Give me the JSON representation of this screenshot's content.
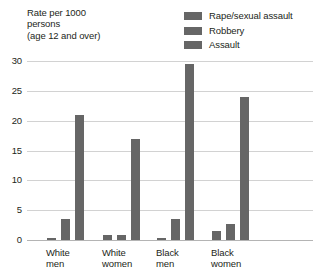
{
  "axis_title": "Rate per 1000\npersons\n(age 12 and over)",
  "legend": {
    "items": [
      {
        "label": "Rape/sexual assault",
        "color": "#666666",
        "icon": "legend-swatch-icon"
      },
      {
        "label": "Robbery",
        "color": "#666666",
        "icon": "legend-swatch-icon"
      },
      {
        "label": "Assault",
        "color": "#666666",
        "icon": "legend-swatch-icon"
      }
    ]
  },
  "chart_data": {
    "type": "bar",
    "title": "",
    "xlabel": "",
    "ylabel": "Rate per 1000 persons (age 12 and over)",
    "ylim": [
      0,
      30
    ],
    "yticks": [
      0,
      5,
      10,
      15,
      20,
      25,
      30
    ],
    "grid": true,
    "legend_position": "top-right",
    "categories": [
      "White\nmen",
      "White\nwomen",
      "Black\nmen",
      "Black\nwomen"
    ],
    "category_labels_flat": [
      "White men",
      "White women",
      "Black men",
      "Black women"
    ],
    "series": [
      {
        "name": "Rape/sexual assault",
        "color": "#666666",
        "values": [
          0.3,
          0.8,
          0.4,
          1.5
        ]
      },
      {
        "name": "Robbery",
        "color": "#666666",
        "values": [
          3.5,
          0.9,
          3.5,
          2.7
        ]
      },
      {
        "name": "Assault",
        "color": "#666666",
        "values": [
          21.0,
          17.0,
          29.5,
          24.0
        ]
      }
    ]
  }
}
